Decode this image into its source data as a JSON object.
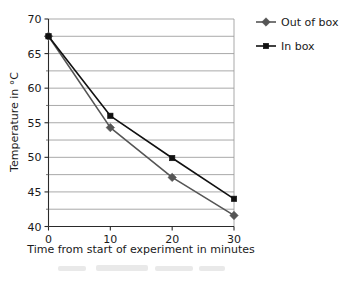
{
  "chart_data": {
    "type": "line",
    "title": "",
    "xlabel": "Time from start of experiment in minutes",
    "ylabel": "Temperature in °C",
    "x": [
      0,
      10,
      20,
      30
    ],
    "xticklabels": [
      "0",
      "10",
      "20",
      "30"
    ],
    "xlim": [
      0,
      30
    ],
    "ylim": [
      40,
      70
    ],
    "yticks": [
      40,
      45,
      50,
      55,
      60,
      65,
      70
    ],
    "yticklabels": [
      "40",
      "45",
      "50",
      "55",
      "60",
      "65",
      "70"
    ],
    "y_minor_ticks": [
      42.5,
      47.5,
      52.5,
      57.5,
      62.5,
      67.5
    ],
    "grid": "horizontal",
    "grid_interval": 2.5,
    "legend_position": "top-right-outside",
    "series": [
      {
        "name": "Out of box",
        "marker": "diamond",
        "color": "#555555",
        "values": [
          67.5,
          54.3,
          47.1,
          41.6
        ]
      },
      {
        "name": "In box",
        "marker": "square",
        "color": "#111111",
        "values": [
          67.5,
          56.0,
          49.9,
          44.0
        ]
      }
    ]
  },
  "legend": {
    "entries": [
      {
        "label": "Out of box"
      },
      {
        "label": "In box"
      }
    ]
  },
  "colors": {
    "out_of_box": "#555555",
    "in_box": "#111111",
    "grid": "#9a9a9a",
    "axis": "#2a2a2a",
    "background": "#ffffff"
  }
}
